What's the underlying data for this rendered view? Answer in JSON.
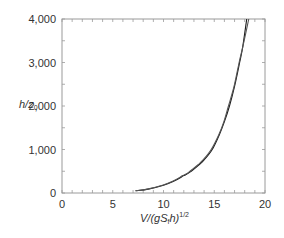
{
  "chart_data": {
    "type": "line",
    "title": "",
    "xlabel": "V/(gS_f h)^1/2",
    "xlabel_parts": {
      "main": "V/(gS",
      "sub": "f",
      "mid": "h)",
      "sup": "1/2"
    },
    "ylabel": "h/z0",
    "ylabel_parts": {
      "main": "h/z",
      "sub": "0"
    },
    "xlim": [
      0,
      20
    ],
    "ylim": [
      0,
      4000
    ],
    "x_ticks": [
      0,
      5,
      10,
      15,
      20
    ],
    "x_tick_labels": [
      "0",
      "5",
      "10",
      "15",
      "20"
    ],
    "y_ticks": [
      0,
      1000,
      2000,
      3000,
      4000
    ],
    "y_tick_labels": [
      "0",
      "1,000",
      "2,000",
      "3,000",
      "4,000"
    ],
    "x_minor_step": 1,
    "y_minor_step": 500,
    "grid": false,
    "legend": null,
    "series": [
      {
        "name": "curve-1",
        "color": "#1a1a1a",
        "points": [
          [
            7.3,
            50
          ],
          [
            8.5,
            90
          ],
          [
            10.0,
            180
          ],
          [
            11.0,
            270
          ],
          [
            12.0,
            400
          ],
          [
            12.6,
            480
          ],
          [
            13.5,
            650
          ],
          [
            14.0,
            760
          ],
          [
            14.8,
            1000
          ],
          [
            15.5,
            1340
          ],
          [
            16.0,
            1640
          ],
          [
            16.5,
            2000
          ],
          [
            17.0,
            2450
          ],
          [
            17.5,
            3000
          ],
          [
            17.8,
            3350
          ],
          [
            18.2,
            4000
          ]
        ]
      },
      {
        "name": "curve-2",
        "color": "#555555",
        "points": [
          [
            7.2,
            50
          ],
          [
            8.4,
            90
          ],
          [
            9.9,
            180
          ],
          [
            10.9,
            270
          ],
          [
            11.9,
            400
          ],
          [
            12.5,
            480
          ],
          [
            13.4,
            650
          ],
          [
            13.9,
            760
          ],
          [
            14.7,
            1000
          ],
          [
            15.45,
            1340
          ],
          [
            15.95,
            1640
          ],
          [
            16.4,
            2000
          ],
          [
            16.95,
            2450
          ],
          [
            17.45,
            3000
          ],
          [
            17.8,
            3350
          ],
          [
            18.4,
            4000
          ]
        ]
      }
    ]
  }
}
